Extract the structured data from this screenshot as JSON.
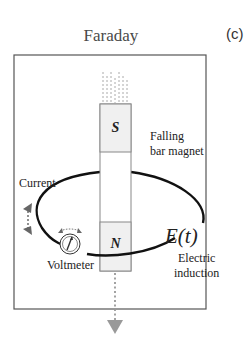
{
  "figure": {
    "title": "Faraday",
    "panel_label": "(c)"
  },
  "magnet": {
    "south_label": "S",
    "north_label": "N",
    "caption_line1": "Falling",
    "caption_line2": "bar magnet"
  },
  "loop": {
    "current_label": "Current",
    "emf_label": "E(t)",
    "induction_line1": "Electric",
    "induction_line2": "induction"
  },
  "meter": {
    "label": "Voltmeter"
  },
  "colors": {
    "frame": "#555555",
    "magnet_pole_fill": "#f0f0f0",
    "magnet_border": "#888888",
    "wire": "#111111",
    "arrow_gray": "#999999"
  }
}
